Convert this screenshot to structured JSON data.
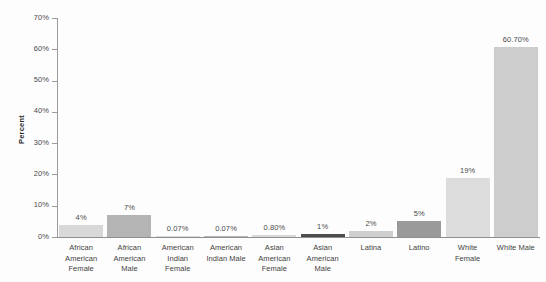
{
  "chart_data": {
    "type": "bar",
    "title": "",
    "subtitle": "",
    "xlabel": "",
    "ylabel": "Percent",
    "ylim": [
      0,
      70
    ],
    "ytick_labels": [
      "0%",
      "10%",
      "20%",
      "30%",
      "40%",
      "50%",
      "60%",
      "70%"
    ],
    "ytick_values": [
      0,
      10,
      20,
      30,
      40,
      50,
      60,
      70
    ],
    "grid": false,
    "legend": "none",
    "categories": [
      "African American Female",
      "African American Male",
      "American Indian Female",
      "American Indian Male",
      "Asian American Female",
      "Asian American Male",
      "Latina",
      "Latino",
      "White Female",
      "White Male"
    ],
    "category_lines": [
      [
        "African",
        "American",
        "Female"
      ],
      [
        "African",
        "American",
        "Male"
      ],
      [
        "American",
        "Indian",
        "Female"
      ],
      [
        "American",
        "Indian Male"
      ],
      [
        "Asian",
        "American",
        "Female"
      ],
      [
        "Asian",
        "American",
        "Male"
      ],
      [
        "Latina"
      ],
      [
        "Latino"
      ],
      [
        "White",
        "Female"
      ],
      [
        "White Male"
      ]
    ],
    "values": [
      4,
      7,
      0.07,
      0.07,
      0.8,
      1,
      2,
      5,
      19,
      60.7
    ],
    "value_labels": [
      "4%",
      "7%",
      "0.07%",
      "0.07%",
      "0.80%",
      "1%",
      "2%",
      "5%",
      "19%",
      "60.70%"
    ],
    "bar_colors": [
      "#d8d8d8",
      "#b4b4b4",
      "#d8d8d8",
      "#b4b4b4",
      "#d8d8d8",
      "#4d4d4d",
      "#cfcfcf",
      "#9a9a9a",
      "#dcdcdc",
      "#cdcdcd"
    ]
  }
}
